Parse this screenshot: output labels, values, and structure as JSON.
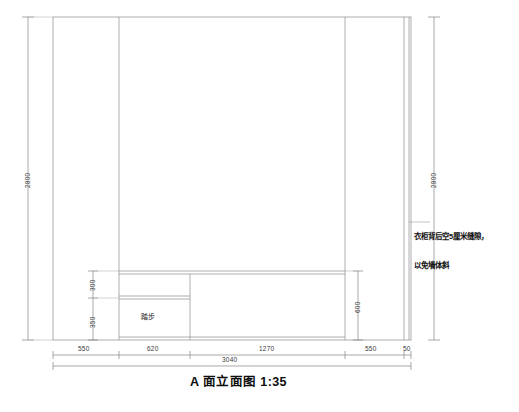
{
  "drawing": {
    "title": "A 面立面图 1:35",
    "inner_labels": [
      {
        "name": "step-label",
        "text": "踏步"
      }
    ],
    "note": {
      "line1": "衣柜背后空5厘米缝隙，",
      "line2": "以免墙体斜"
    },
    "vertical_dimensions": [
      {
        "name": "overall-height-left",
        "value": "2800"
      },
      {
        "name": "overall-height-right",
        "value": "2800"
      },
      {
        "name": "upper-shelf-height",
        "value": "300"
      },
      {
        "name": "lower-step-height",
        "value": "350"
      },
      {
        "name": "cabinet-base-height",
        "value": "600"
      }
    ],
    "horizontal_dimensions": [
      {
        "name": "segment-left-wall",
        "value": "550"
      },
      {
        "name": "segment-step-width",
        "value": "620"
      },
      {
        "name": "segment-middle",
        "value": "1270"
      },
      {
        "name": "segment-right-wall",
        "value": "550"
      },
      {
        "name": "segment-gap",
        "value": "50"
      },
      {
        "name": "overall-width",
        "value": "3040"
      }
    ],
    "colors": {
      "line": "#8d8d8d",
      "line_dark": "#4a4a4a",
      "text": "#1a1a1a",
      "background": "#ffffff"
    }
  }
}
